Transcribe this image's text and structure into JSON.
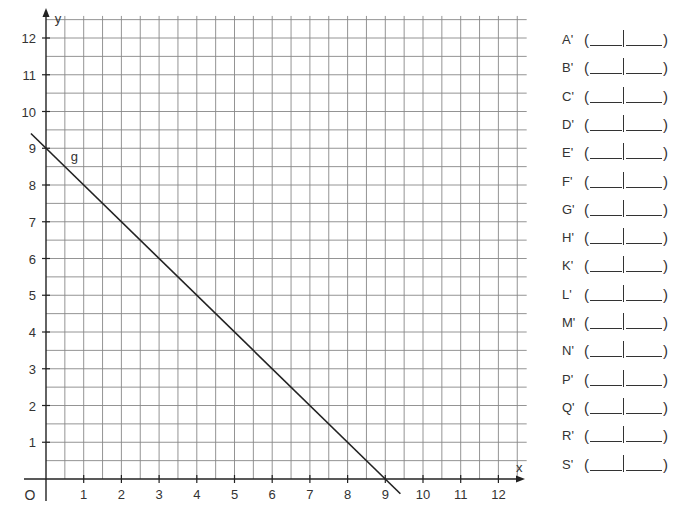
{
  "chart_data": {
    "type": "line",
    "title": "",
    "xlabel": "x",
    "ylabel": "y",
    "origin_label": "O",
    "xlim": [
      0,
      12.75
    ],
    "ylim": [
      0,
      12.6
    ],
    "grid": true,
    "grid_step": 0.5,
    "x_ticks": [
      1,
      2,
      3,
      4,
      5,
      6,
      7,
      8,
      9,
      10,
      11,
      12
    ],
    "y_ticks": [
      1,
      2,
      3,
      4,
      5,
      6,
      7,
      8,
      9,
      10,
      11,
      12
    ],
    "series": [
      {
        "name": "g",
        "label": "g",
        "equation": "y = -x + 9",
        "x": [
          -0.4,
          9.4
        ],
        "y": [
          9.4,
          -0.4
        ]
      }
    ]
  },
  "answer_list": {
    "items": [
      {
        "label": "A'",
        "open": "(",
        "close": ")"
      },
      {
        "label": "B'",
        "open": "(",
        "close": ")"
      },
      {
        "label": "C'",
        "open": "(",
        "close": ")"
      },
      {
        "label": "D'",
        "open": "(",
        "close": ")"
      },
      {
        "label": "E'",
        "open": "(",
        "close": ")"
      },
      {
        "label": "F'",
        "open": "(",
        "close": ")"
      },
      {
        "label": "G'",
        "open": "(",
        "close": ")"
      },
      {
        "label": "H'",
        "open": "(",
        "close": ")"
      },
      {
        "label": "K'",
        "open": "(",
        "close": ")"
      },
      {
        "label": "L'",
        "open": "(",
        "close": ")"
      },
      {
        "label": "M'",
        "open": "(",
        "close": ")"
      },
      {
        "label": "N'",
        "open": "(",
        "close": ")"
      },
      {
        "label": "P'",
        "open": "(",
        "close": ")"
      },
      {
        "label": "Q'",
        "open": "(",
        "close": ")"
      },
      {
        "label": "R'",
        "open": "(",
        "close": ")"
      },
      {
        "label": "S'",
        "open": "(",
        "close": ")"
      }
    ]
  },
  "colors": {
    "grid": "#888888",
    "axis": "#222222",
    "line": "#222222",
    "text": "#333333"
  }
}
